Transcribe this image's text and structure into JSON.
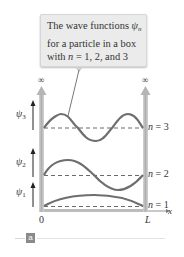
{
  "callout": {
    "line1_prefix": "The wave functions ",
    "line1_symbol": "ψ",
    "line1_sub": "n",
    "line2": "for a particle in a box",
    "line3_prefix": "with ",
    "line3_var": "n",
    "line3_suffix": " = 1, 2, and 3"
  },
  "walls": {
    "left_top_label": "∞",
    "right_top_label": "∞"
  },
  "axis": {
    "origin_label": "0",
    "end_label": "L",
    "x_label": "x"
  },
  "psi_labels": [
    {
      "symbol": "ψ",
      "sub": "3"
    },
    {
      "symbol": "ψ",
      "sub": "2"
    },
    {
      "symbol": "ψ",
      "sub": "1"
    }
  ],
  "level_labels": [
    {
      "var": "n",
      "text": " = 3"
    },
    {
      "var": "n",
      "text": " = 2"
    },
    {
      "var": "n",
      "text": " = 1"
    }
  ],
  "figure_tag": "a",
  "colors": {
    "wave": "#6e6e6e",
    "wall": "#bdbdbd",
    "dashed": "#6a6a6a",
    "callout_bg": "#ebebeb"
  }
}
